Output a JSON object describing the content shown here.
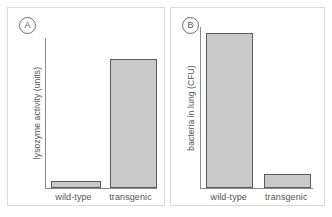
{
  "figure": {
    "background": "#ffffff",
    "bar_fill": "#c9c9c9",
    "bar_stroke": "#5b5b5b",
    "axis_color": "#8c8c8c",
    "frame_color": "#d9d9d9",
    "text_color": "#555555"
  },
  "panels": [
    {
      "tag": "A",
      "ylabel": "lysozyme activity (units)",
      "categories": [
        "wild-type",
        "transgenic"
      ]
    },
    {
      "tag": "B",
      "ylabel": "bacteria in lung (CFU)",
      "categories": [
        "wild-type",
        "transgenic"
      ]
    }
  ],
  "chart_data": [
    {
      "type": "bar",
      "panel": "A",
      "title": "",
      "xlabel": "",
      "ylabel": "lysozyme activity (units)",
      "categories": [
        "wild-type",
        "transgenic"
      ],
      "values": [
        5,
        86
      ],
      "ylim": [
        0,
        100
      ],
      "grid": false,
      "legend": "none",
      "units": "relative (axis unlabeled)"
    },
    {
      "type": "bar",
      "panel": "B",
      "title": "",
      "xlabel": "",
      "ylabel": "bacteria in lung (CFU)",
      "categories": [
        "wild-type",
        "transgenic"
      ],
      "values": [
        96,
        9
      ],
      "ylim": [
        0,
        100
      ],
      "grid": false,
      "legend": "none",
      "units": "relative (axis unlabeled)"
    }
  ]
}
